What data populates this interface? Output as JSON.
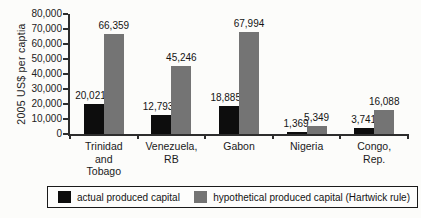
{
  "figure": {
    "background": "#fcfcfa"
  },
  "chart_data": {
    "type": "bar",
    "title": "",
    "xlabel": "",
    "ylabel": "2005 US$ per captia",
    "ylim": [
      0,
      80000
    ],
    "ytick_step": 10000,
    "ytick_labels": [
      "0",
      "10,000",
      "20,000",
      "30,000",
      "40,000",
      "50,000",
      "60,000",
      "70,000",
      "80,000"
    ],
    "grid": false,
    "legend_position": "bottom-boxed",
    "categories": [
      "Trinidad and Tobago",
      "Venezuela, RB",
      "Gabon",
      "Nigeria",
      "Congo, Rep."
    ],
    "category_label_lines": [
      "Trinidad\nand\nTobago",
      "Venezuela,\nRB",
      "Gabon",
      "Nigeria",
      "Congo, Rep."
    ],
    "series": [
      {
        "name": "actual produced capital",
        "color": "#0d0d0d",
        "values": [
          20021,
          12793,
          18885,
          1369,
          3741
        ],
        "value_labels": [
          "20,021",
          "12,793",
          "18,885",
          "1,369",
          "3,741"
        ]
      },
      {
        "name": "hypothetical produced capital (Hartwick rule)",
        "color": "#747474",
        "values": [
          66359,
          45246,
          67994,
          5349,
          16088
        ],
        "value_labels": [
          "66,359",
          "45,246",
          "67,994",
          "5,349",
          "16,088"
        ]
      }
    ]
  }
}
